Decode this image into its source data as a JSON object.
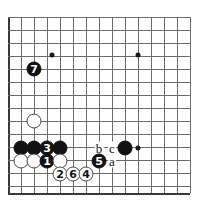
{
  "figure": {
    "name": "go-board-diagram",
    "type": "go-joseki-diagram",
    "board_pixel_size": [
      204,
      207
    ],
    "grid_spacing": 13,
    "origin": [
      8,
      17
    ],
    "colors": {
      "background": "#ffffff",
      "grid_line": "#6b6b6b",
      "board_edge": "#3a3a3a",
      "black_stone": "#121212",
      "white_stone": "#ffffff",
      "white_stone_border": "#4a4a4a",
      "label_text": "#111111",
      "number_on_black": "#ffffff",
      "number_on_white": "#121212"
    }
  },
  "grid": {
    "vertical_x": [
      8,
      21,
      34,
      47,
      60,
      73,
      86,
      99,
      112,
      125,
      138,
      151,
      164,
      177,
      190
    ],
    "horizontal_y": [
      17,
      30,
      43,
      56,
      69,
      82,
      95,
      108,
      121,
      134,
      147,
      160,
      173,
      186,
      193
    ],
    "left_edge_x": 8,
    "bottom_edge_y": 193
  },
  "hoshi_points": [
    {
      "name": "hoshi-upper-left",
      "x": 52,
      "y": 55
    },
    {
      "name": "hoshi-upper-right",
      "x": 138,
      "y": 55
    },
    {
      "name": "hoshi-lower-right",
      "x": 138,
      "y": 148
    }
  ],
  "stones": [
    {
      "name": "black-stone-a1",
      "color": "black",
      "x": 21,
      "y": 148,
      "label": ""
    },
    {
      "name": "black-stone-a2",
      "color": "black",
      "x": 34,
      "y": 148,
      "label": ""
    },
    {
      "name": "black-move-3",
      "color": "black",
      "x": 47,
      "y": 148,
      "label": "3"
    },
    {
      "name": "black-stone-a3",
      "color": "black",
      "x": 60,
      "y": 148,
      "label": ""
    },
    {
      "name": "black-stone-a4",
      "color": "black",
      "x": 125,
      "y": 148,
      "label": ""
    },
    {
      "name": "white-stone-b1",
      "color": "white",
      "x": 34,
      "y": 121,
      "label": ""
    },
    {
      "name": "white-stone-b2",
      "color": "white",
      "x": 21,
      "y": 161,
      "label": ""
    },
    {
      "name": "white-stone-b3",
      "color": "white",
      "x": 34,
      "y": 161,
      "label": ""
    },
    {
      "name": "black-move-1",
      "color": "black",
      "x": 47,
      "y": 161,
      "label": "1"
    },
    {
      "name": "white-stone-b4",
      "color": "white",
      "x": 60,
      "y": 161,
      "label": ""
    },
    {
      "name": "black-move-5",
      "color": "black",
      "x": 99,
      "y": 161,
      "label": "5"
    },
    {
      "name": "white-move-2",
      "color": "white",
      "x": 60,
      "y": 174,
      "label": "2"
    },
    {
      "name": "white-move-6",
      "color": "white",
      "x": 73,
      "y": 174,
      "label": "6"
    },
    {
      "name": "white-move-4",
      "color": "white",
      "x": 86,
      "y": 174,
      "label": "4"
    },
    {
      "name": "black-move-7",
      "color": "black",
      "x": 34,
      "y": 69,
      "label": "7"
    }
  ],
  "letter_markers": [
    {
      "name": "point-marker-b",
      "text": "b",
      "x": 99,
      "y": 148
    },
    {
      "name": "point-marker-c",
      "text": "c",
      "x": 112,
      "y": 148
    },
    {
      "name": "point-marker-a",
      "text": "a",
      "x": 112,
      "y": 161
    }
  ]
}
